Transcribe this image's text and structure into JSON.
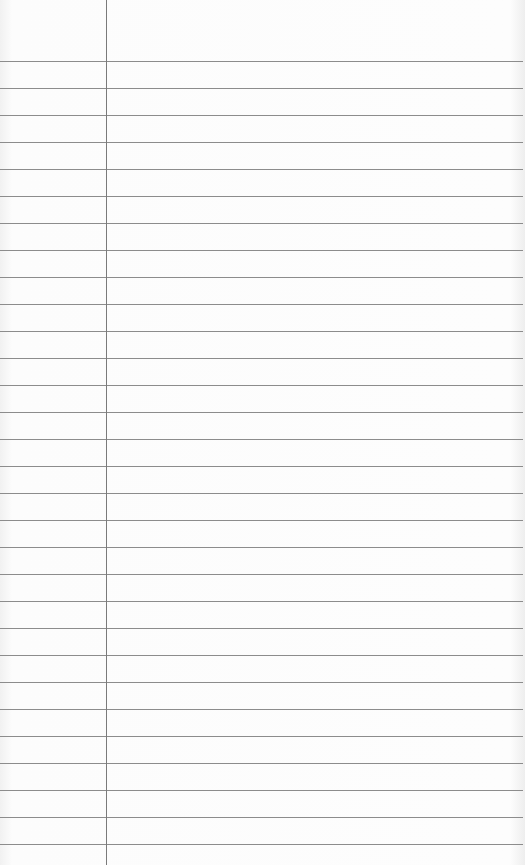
{
  "paper": {
    "type": "lined-notepaper",
    "background_color": "#fbfbfb",
    "rule_color": "#8c8c8c",
    "margin_color": "#7a7a7a",
    "margin_x": 106,
    "first_rule_y": 61,
    "rule_spacing": 27,
    "rule_count": 30
  }
}
